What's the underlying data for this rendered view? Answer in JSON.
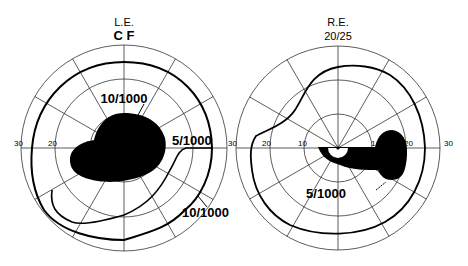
{
  "left_field": {
    "eye_label": "L.E.",
    "acuity_label": "C F",
    "ticks": {
      "left_30": "30",
      "left_20": "20",
      "left_10": "1",
      "right_30": "30"
    },
    "isopters": {
      "inner": "10/1000",
      "middle": "5/1000",
      "outer": "10/1000"
    }
  },
  "right_field": {
    "eye_label": "R.E.",
    "acuity_label": "20/25",
    "ticks": {
      "left_20": "20",
      "left_10": "10",
      "right_10": "1",
      "right_20": "20",
      "right_30": "30"
    },
    "isopters": {
      "scotoma": "5/1000"
    }
  },
  "colors": {
    "ink": "#000000",
    "grid": "#333333",
    "background": "#ffffff"
  }
}
